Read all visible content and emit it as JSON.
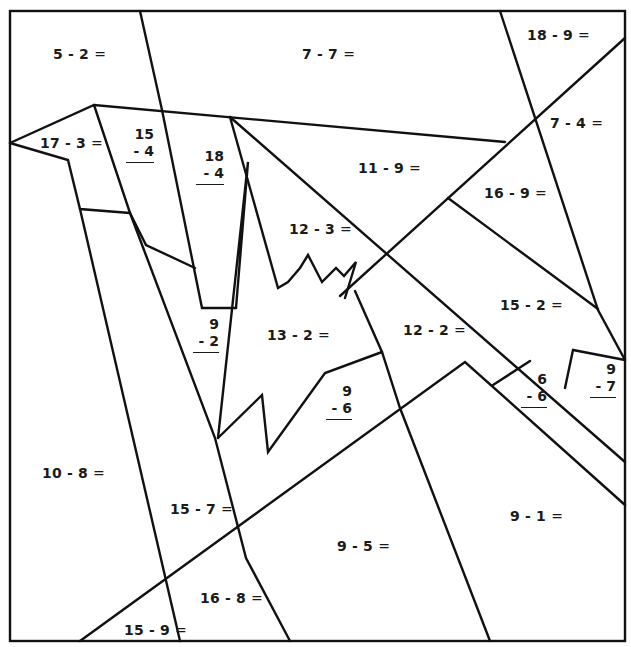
{
  "worksheet": {
    "type": "color-by-number subtraction worksheet",
    "line_color": "#111111",
    "background": "#ffffff",
    "horizontal_problems": [
      {
        "id": "p-5-2",
        "text": "5 - 2",
        "eq": "=",
        "x": 53,
        "y": 46
      },
      {
        "id": "p-7-7",
        "text": "7 - 7",
        "eq": "=",
        "x": 302,
        "y": 46
      },
      {
        "id": "p-18-9",
        "text": "18 - 9",
        "eq": "=",
        "x": 527,
        "y": 27
      },
      {
        "id": "p-17-3",
        "text": "17 - 3",
        "eq": "=",
        "x": 40,
        "y": 135
      },
      {
        "id": "p-7-4",
        "text": "7 - 4",
        "eq": "=",
        "x": 550,
        "y": 115
      },
      {
        "id": "p-11-9",
        "text": "11 - 9",
        "eq": "=",
        "x": 358,
        "y": 160
      },
      {
        "id": "p-16-9",
        "text": "16 - 9",
        "eq": "=",
        "x": 484,
        "y": 185
      },
      {
        "id": "p-12-3",
        "text": "12 - 3",
        "eq": "=",
        "x": 289,
        "y": 221
      },
      {
        "id": "p-15-2",
        "text": "15 - 2",
        "eq": "=",
        "x": 500,
        "y": 297
      },
      {
        "id": "p-12-2",
        "text": "12 - 2",
        "eq": "=",
        "x": 403,
        "y": 322
      },
      {
        "id": "p-13-2",
        "text": "13 - 2",
        "eq": "=",
        "x": 267,
        "y": 327
      },
      {
        "id": "p-10-8",
        "text": "10 - 8",
        "eq": "=",
        "x": 42,
        "y": 465
      },
      {
        "id": "p-15-7",
        "text": "15 - 7",
        "eq": "=",
        "x": 170,
        "y": 501
      },
      {
        "id": "p-9-1",
        "text": "9 - 1",
        "eq": "=",
        "x": 510,
        "y": 508
      },
      {
        "id": "p-9-5",
        "text": "9 - 5",
        "eq": "=",
        "x": 337,
        "y": 538
      },
      {
        "id": "p-16-8",
        "text": "16 - 8",
        "eq": "=",
        "x": 200,
        "y": 590
      },
      {
        "id": "p-15-9",
        "text": "15 - 9",
        "eq": "=",
        "x": 124,
        "y": 622
      }
    ],
    "vertical_problems": [
      {
        "id": "v-15-4",
        "top": "15",
        "bottom": "- 4",
        "x": 126,
        "y": 126
      },
      {
        "id": "v-18-4",
        "top": "18",
        "bottom": "- 4",
        "x": 196,
        "y": 148
      },
      {
        "id": "v-9-2",
        "top": "9",
        "bottom": "- 2",
        "x": 193,
        "y": 316
      },
      {
        "id": "v-9-6",
        "top": "9",
        "bottom": "- 6",
        "x": 326,
        "y": 383
      },
      {
        "id": "v-6-6",
        "top": "6",
        "bottom": "- 6",
        "x": 521,
        "y": 371
      },
      {
        "id": "v-9-7",
        "top": "9",
        "bottom": "- 7",
        "x": 590,
        "y": 361
      }
    ]
  }
}
